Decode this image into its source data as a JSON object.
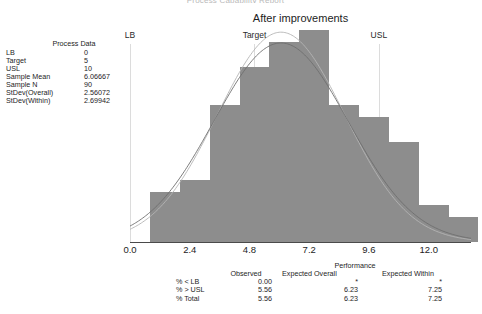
{
  "clipped_title": "Process Capability Report",
  "chart": {
    "title": "After improvements"
  },
  "process_data": {
    "heading": "Process Data",
    "rows": [
      {
        "label": "LB",
        "value": "0"
      },
      {
        "label": "Target",
        "value": "5"
      },
      {
        "label": "USL",
        "value": "10"
      },
      {
        "label": "Sample Mean",
        "value": "6.06667"
      },
      {
        "label": "Sample N",
        "value": "90"
      },
      {
        "label": "StDev(Overall)",
        "value": "2.56072"
      },
      {
        "label": "StDev(Within)",
        "value": "2.69942"
      }
    ]
  },
  "spec_lines": [
    {
      "name": "LB",
      "label": "LB",
      "value": 0
    },
    {
      "name": "Target",
      "label": "Target",
      "value": 5
    },
    {
      "name": "USL",
      "label": "USL",
      "value": 10
    }
  ],
  "performance": {
    "title": "Performance",
    "columns": [
      "",
      "Observed",
      "Expected Overall",
      "Expected Within"
    ],
    "rows": [
      {
        "label": "% < LB",
        "observed": "0.00",
        "expected_overall": "*",
        "expected_within": "*"
      },
      {
        "label": "% > USL",
        "observed": "5.56",
        "expected_overall": "6.23",
        "expected_within": "7.25"
      },
      {
        "label": "% Total",
        "observed": "5.56",
        "expected_overall": "6.23",
        "expected_within": "7.25"
      }
    ]
  },
  "chart_data": {
    "type": "bar",
    "title": "After improvements",
    "xlabel": "",
    "ylabel": "",
    "xlim": [
      0.0,
      13.7
    ],
    "ylim": [
      0,
      17
    ],
    "grid": false,
    "legend": "none",
    "tick_labels": [
      "0.0",
      "2.4",
      "4.8",
      "7.2",
      "9.6",
      "12.0"
    ],
    "tick_values": [
      0.0,
      2.4,
      4.8,
      7.2,
      9.6,
      12.0
    ],
    "bin_width": 1.2,
    "bin_centers": [
      1.4,
      2.6,
      3.8,
      5.0,
      6.2,
      7.4,
      8.6,
      9.8,
      11.0,
      12.2,
      13.4
    ],
    "values": [
      4,
      5,
      11,
      14,
      16,
      17,
      11,
      10,
      8,
      3,
      2
    ],
    "colors": {
      "bar_fill": "#8d8d8d",
      "axis": "#4a4a4a",
      "spec_line": "#dcdcdc",
      "curve_overall": "#b4b4b4",
      "curve_within": "#6e6e6e"
    },
    "curves": [
      {
        "name": "Overall",
        "mean": 6.06667,
        "stdev": 2.56072,
        "color": "#b4b4b4"
      },
      {
        "name": "Within",
        "mean": 6.06667,
        "stdev": 2.69942,
        "color": "#6e6e6e"
      }
    ]
  }
}
